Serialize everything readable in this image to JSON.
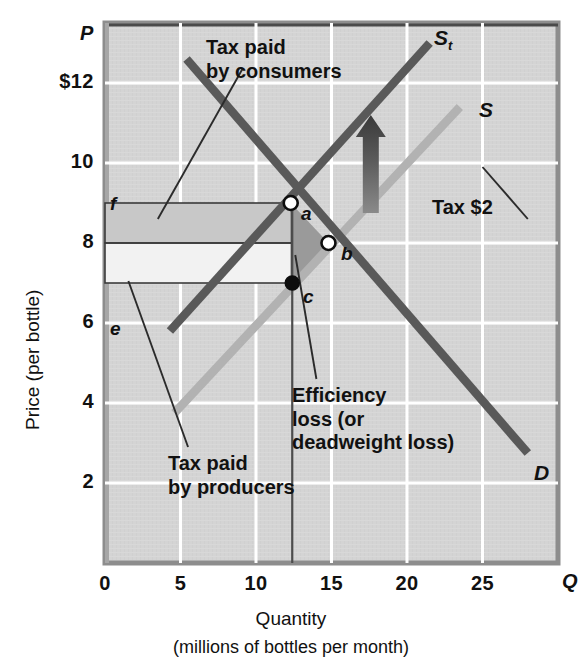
{
  "chart_data": {
    "type": "line",
    "title": "",
    "xlabel": "Quantity",
    "xlabel_sub": "(millions of bottles per month)",
    "ylabel": "Price (per bottle)",
    "x_axis_symbol": "Q",
    "y_axis_symbol": "P",
    "xlim": [
      0,
      30
    ],
    "ylim": [
      0,
      13.5
    ],
    "grid": true,
    "x_ticks": [
      {
        "value": 0,
        "label": "0"
      },
      {
        "value": 5,
        "label": "5"
      },
      {
        "value": 10,
        "label": "10"
      },
      {
        "value": 15,
        "label": "15"
      },
      {
        "value": 20,
        "label": "20"
      },
      {
        "value": 25,
        "label": "25"
      }
    ],
    "y_ticks": [
      {
        "value": 2,
        "label": "2"
      },
      {
        "value": 4,
        "label": "4"
      },
      {
        "value": 6,
        "label": "6"
      },
      {
        "value": 8,
        "label": "8"
      },
      {
        "value": 10,
        "label": "10"
      },
      {
        "value": 12,
        "label": "$12"
      }
    ],
    "series": [
      {
        "name": "S_t",
        "label": "S",
        "label_sub": "t",
        "role": "supply-after-tax",
        "color": "#595959",
        "points": [
          [
            4.3,
            5.8
          ],
          [
            21.5,
            13.0
          ]
        ]
      },
      {
        "name": "S",
        "label": "S",
        "role": "supply-before-tax",
        "color": "#b2b2b2",
        "points": [
          [
            4.6,
            3.75
          ],
          [
            23.5,
            11.4
          ]
        ]
      },
      {
        "name": "D",
        "label": "D",
        "role": "demand",
        "color": "#595959",
        "points": [
          [
            5.4,
            12.6
          ],
          [
            28.0,
            2.75
          ]
        ]
      }
    ],
    "points": [
      {
        "id": "a",
        "label": "a",
        "q": 12.3,
        "p": 9.0,
        "style": "open"
      },
      {
        "id": "b",
        "label": "b",
        "q": 14.8,
        "p": 8.0,
        "style": "open"
      },
      {
        "id": "c",
        "label": "c",
        "q": 12.4,
        "p": 7.0,
        "style": "filled"
      },
      {
        "id": "f",
        "label": "f",
        "q": 0.4,
        "p": 9.5,
        "style": "none"
      },
      {
        "id": "e",
        "label": "e",
        "q": 0.4,
        "p": 6.5,
        "style": "none"
      }
    ],
    "regions": [
      {
        "id": "tax-paid-by-consumers",
        "label": "Tax paid\nby consumers",
        "color": "#c8c8c8",
        "bounds": {
          "q0": 0,
          "q1": 12.35,
          "p0": 8.0,
          "p1": 9.0
        }
      },
      {
        "id": "tax-paid-by-producers",
        "label": "Tax paid\nby producers",
        "color": "#f2f2f2",
        "bounds": {
          "q0": 0,
          "q1": 12.35,
          "p0": 7.0,
          "p1": 8.0
        }
      },
      {
        "id": "efficiency-loss",
        "label": "Efficiency\nloss (or\ndeadweight loss)",
        "color": "#9a9a9a",
        "vertices": [
          [
            12.3,
            9.0
          ],
          [
            14.8,
            8.0
          ],
          [
            12.4,
            7.0
          ]
        ]
      }
    ],
    "annotations": [
      {
        "id": "tax-paid-by-consumers",
        "lines": [
          "Tax paid",
          "by consumers"
        ],
        "leader": {
          "from": [
            9.1,
            12.35
          ],
          "to": [
            3.5,
            8.6
          ]
        }
      },
      {
        "id": "tax-paid-by-producers",
        "lines": [
          "Tax paid",
          "by producers"
        ],
        "leader": {
          "from": [
            5.5,
            2.9
          ],
          "to": [
            1.55,
            7.05
          ]
        }
      },
      {
        "id": "efficiency-loss",
        "lines": [
          "Efficiency",
          "loss (or",
          "deadweight loss)"
        ],
        "leader": {
          "from": [
            14.0,
            4.6
          ],
          "to": [
            12.6,
            7.7
          ]
        }
      },
      {
        "id": "tax-amount",
        "lines": [
          "Tax $2"
        ],
        "value": "$2",
        "leader": {
          "from": [
            28.0,
            8.6
          ],
          "to": [
            25.0,
            9.9
          ]
        }
      }
    ],
    "shift_arrow": {
      "id": "supply-shift-arrow",
      "direction": "up",
      "q": 17.6,
      "p_from": 8.75,
      "p_to": 11.2,
      "color": "#4a4a4a"
    },
    "equilibrium_note": {
      "quantity_after_tax": 12.5,
      "price_consumers_pay": 9.0,
      "price_producers_receive": 7.0,
      "tax_per_unit": 2.0
    }
  },
  "plot": {
    "background": "#d4d4d4",
    "grid_color": "#ffffff",
    "frame_color": "#7b7b7b"
  }
}
